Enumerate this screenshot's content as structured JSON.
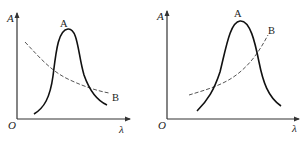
{
  "panels": [
    {
      "id": "left",
      "y_axis_label": "A",
      "x_axis_label": "λ",
      "origin_label": "O",
      "curve_a_label": "A",
      "curve_b_label": "B",
      "curve_a_style": "solid",
      "curve_b_style": "dashed",
      "curve_b_trend": "decreasing"
    },
    {
      "id": "right",
      "y_axis_label": "A",
      "x_axis_label": "λ",
      "origin_label": "O",
      "curve_a_label": "A",
      "curve_b_label": "B",
      "curve_a_style": "solid",
      "curve_b_style": "dashed",
      "curve_b_trend": "increasing"
    }
  ],
  "colors": {
    "axis": "#333333",
    "curve_a": "#111111",
    "curve_b": "#555555",
    "text": "#222222"
  }
}
